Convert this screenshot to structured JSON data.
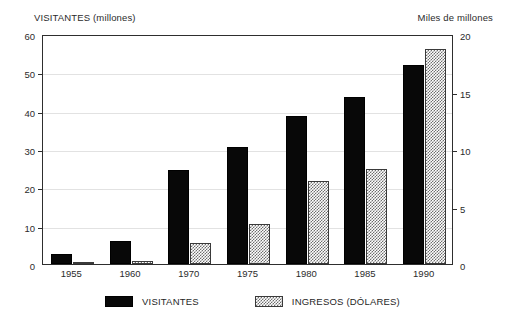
{
  "chart_data": {
    "type": "bar",
    "title": "",
    "subtitle": "",
    "categories": [
      "1955",
      "1960",
      "1970",
      "1975",
      "1980",
      "1985",
      "1990"
    ],
    "series": [
      {
        "name": "VISITANTES",
        "axis": "left",
        "unit": "millones",
        "color": "#080808",
        "fill": "solid-black",
        "values": [
          2.5,
          6.0,
          24.5,
          30.5,
          38.5,
          43.5,
          52.0
        ]
      },
      {
        "name": "INGRESOS (DÓLARES)",
        "axis": "right",
        "unit": "miles de millones",
        "color": "#6e6e6e",
        "fill": "cross-hatch",
        "values": [
          0.1,
          0.3,
          1.8,
          3.5,
          7.2,
          8.3,
          18.7
        ]
      }
    ],
    "xlabel": "",
    "ylabel": "VISITANTES (millones)",
    "y2label": "Miles de millones",
    "ylim": [
      0,
      60
    ],
    "y2lim": [
      0,
      20
    ],
    "yticks": [
      0,
      10,
      20,
      30,
      40,
      50,
      60
    ],
    "y2ticks": [
      0,
      5,
      10,
      15,
      20
    ],
    "grid": true,
    "legend_position": "bottom-center"
  },
  "axes": {
    "left_title": "VISITANTES (millones)",
    "right_title": "Miles de millones",
    "left_ticks": [
      "0",
      "10",
      "20",
      "30",
      "40",
      "50",
      "60"
    ],
    "right_ticks": [
      "0",
      "5",
      "10",
      "15",
      "20"
    ]
  },
  "xaxis": {
    "labels": [
      "1955",
      "1960",
      "1970",
      "1975",
      "1980",
      "1985",
      "1990"
    ]
  },
  "legend": {
    "items": [
      {
        "label": "VISITANTES",
        "swatch": "solid-black-swatch"
      },
      {
        "label": "INGRESOS (DÓLARES)",
        "swatch": "cross-hatch-swatch"
      }
    ]
  }
}
